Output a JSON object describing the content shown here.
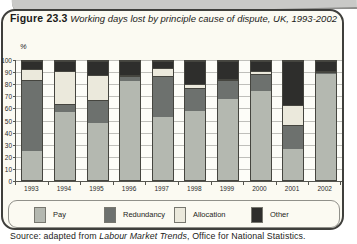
{
  "figure": {
    "label": "Figure 23.3",
    "title": "Working days lost by principle cause of dispute, UK, 1993-2002",
    "unit_label": "%",
    "source_prefix": "Source: adapted from ",
    "source_italic": "Labour Market Trends",
    "source_suffix": ", Office for National Statistics."
  },
  "chart_data": {
    "type": "bar",
    "stacked": true,
    "title": "Working days lost by principle cause of dispute, UK, 1993-2002",
    "ylabel": "%",
    "xlabel": "",
    "ylim": [
      0,
      100
    ],
    "yticks": [
      0,
      10,
      20,
      30,
      40,
      50,
      60,
      70,
      80,
      90,
      100
    ],
    "grid": true,
    "legend_position": "bottom",
    "categories": [
      "1993",
      "1994",
      "1995",
      "1996",
      "1997",
      "1998",
      "1999",
      "2000",
      "2001",
      "2002"
    ],
    "series": [
      {
        "name": "Pay",
        "color": "#b4b8b0",
        "values": [
          24,
          57,
          48,
          83,
          53,
          58,
          68,
          75,
          26,
          89
        ]
      },
      {
        "name": "Redundancy",
        "color": "#6d716e",
        "values": [
          60,
          7,
          19,
          4,
          34,
          19,
          16,
          14,
          20,
          2
        ]
      },
      {
        "name": "Allocation",
        "color": "#ebe9dc",
        "values": [
          9,
          28,
          21,
          1,
          7,
          4,
          1,
          3,
          17,
          1
        ]
      },
      {
        "name": "Other",
        "color": "#2e2e2c",
        "values": [
          7,
          8,
          12,
          12,
          6,
          19,
          15,
          8,
          37,
          8
        ]
      }
    ]
  }
}
